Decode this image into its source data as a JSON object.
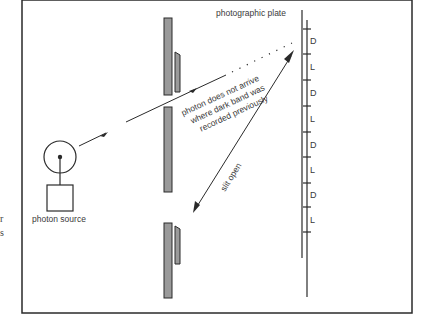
{
  "diagram": {
    "labels": {
      "plate": "photographic plate",
      "source": "photon source",
      "no_arrive_line1": "photon does not arrive",
      "no_arrive_line2": "where dark band was",
      "no_arrive_line3": "recorded previously",
      "slit_open": "slit open"
    },
    "bands": [
      "D",
      "L",
      "D",
      "L",
      "D",
      "L",
      "D",
      "L"
    ],
    "margin_fragments": [
      "r",
      "s"
    ],
    "colors": {
      "line": "#2a2a2a",
      "barrier_fill": "#9a9a9a",
      "text": "#3a3a3a",
      "background": "#ffffff"
    }
  }
}
